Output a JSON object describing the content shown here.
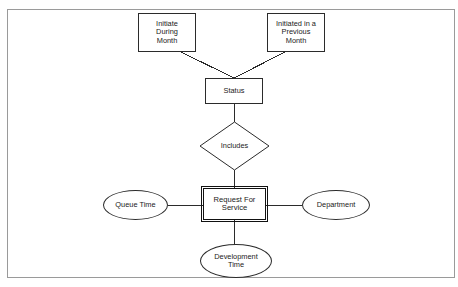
{
  "diagram": {
    "type": "entity-relationship-diagram",
    "frame": {
      "border_color": "#9a9a9a",
      "background": "#ffffff"
    },
    "line_color": "#2b2b2b",
    "text_color": "#1a1a1a",
    "nodes": {
      "initiate_during_month": {
        "label": "Initiate\nDuring\nMonth",
        "shape": "rectangle",
        "x": 138,
        "y": 13,
        "w": 58,
        "h": 39
      },
      "initiated_previous_month": {
        "label": "Initiated in a\nPrevious\nMonth",
        "shape": "rectangle",
        "x": 267,
        "y": 13,
        "w": 58,
        "h": 39
      },
      "status": {
        "label": "Status",
        "shape": "rectangle",
        "x": 205,
        "y": 78,
        "w": 58,
        "h": 26
      },
      "includes": {
        "label": "Includes",
        "shape": "diamond",
        "x": 200,
        "y": 122,
        "w": 69,
        "h": 48
      },
      "request_for_service": {
        "label": "Request For\nService",
        "shape": "rectangle-strong",
        "x": 203,
        "y": 188,
        "w": 63,
        "h": 32
      },
      "queue_time": {
        "label": "Queue Time",
        "shape": "ellipse",
        "x": 103,
        "y": 190,
        "w": 65,
        "h": 30
      },
      "department": {
        "label": "Department",
        "shape": "ellipse",
        "x": 302,
        "y": 190,
        "w": 68,
        "h": 30
      },
      "development_time": {
        "label": "Development\nTime",
        "shape": "ellipse",
        "x": 200,
        "y": 244,
        "w": 72,
        "h": 34
      }
    },
    "edges": [
      {
        "name": "initiate-during-month-to-status",
        "from": "initiate_during_month",
        "to": "status",
        "x1": 181,
        "y1": 52,
        "x2": 234,
        "y2": 78
      },
      {
        "name": "initiated-previous-month-to-status",
        "from": "initiated_previous_month",
        "to": "status",
        "x1": 285,
        "y1": 52,
        "x2": 234,
        "y2": 78
      },
      {
        "name": "status-to-includes",
        "from": "status",
        "to": "includes",
        "x1": 234,
        "y1": 104,
        "x2": 234,
        "y2": 122
      },
      {
        "name": "includes-to-request-for-service",
        "from": "includes",
        "to": "request_for_service",
        "x1": 234,
        "y1": 170,
        "x2": 234,
        "y2": 188
      },
      {
        "name": "queue-time-to-request-for-service",
        "from": "queue_time",
        "to": "request_for_service",
        "x1": 168,
        "y1": 205,
        "x2": 203,
        "y2": 205
      },
      {
        "name": "request-for-service-to-department",
        "from": "request_for_service",
        "to": "department",
        "x1": 266,
        "y1": 205,
        "x2": 302,
        "y2": 205
      },
      {
        "name": "request-for-service-to-development-time",
        "from": "request_for_service",
        "to": "development_time",
        "x1": 234,
        "y1": 220,
        "x2": 234,
        "y2": 246
      }
    ]
  }
}
